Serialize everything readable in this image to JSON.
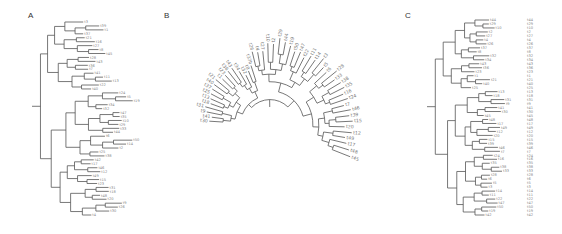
{
  "figure": {
    "panels": [
      {
        "label": "A",
        "type": "rectangular-tree",
        "tip_layout": "staggered"
      },
      {
        "label": "B",
        "type": "fan-tree"
      },
      {
        "label": "C",
        "type": "rectangular-tree",
        "tip_layout": "aligned"
      }
    ],
    "colors": {
      "branch": "#555555",
      "tip_label": "#888888",
      "panel_label": "#333333",
      "background": "#ffffff"
    }
  },
  "panelA": {
    "label": "A",
    "tips": [
      "t3",
      "t39",
      "t1",
      "t37",
      "t21",
      "t16",
      "t27",
      "t8",
      "t45",
      "t28",
      "t43",
      "t36",
      "t7",
      "t41",
      "t11",
      "t13",
      "t22",
      "t40",
      "t24",
      "t5",
      "t19",
      "t34",
      "t32",
      "t47",
      "t35",
      "t10",
      "t29",
      "t33",
      "t44",
      "t6",
      "t50",
      "t14",
      "t2",
      "t25",
      "t38",
      "t42",
      "t17",
      "t46",
      "t12",
      "t49",
      "t15",
      "t23",
      "t31",
      "t18",
      "t48",
      "t20",
      "t9",
      "t26",
      "t30",
      "t4"
    ]
  },
  "panelB": {
    "label": "B",
    "tips": [
      "t30",
      "t41",
      "t9",
      "t31",
      "t18",
      "t13",
      "t25",
      "t37",
      "t40",
      "t21",
      "t1",
      "t23",
      "t36",
      "t43",
      "t34",
      "t32",
      "t8",
      "t37b",
      "t26",
      "t4",
      "t27",
      "t10",
      "t2",
      "t29",
      "t44",
      "t19",
      "t50",
      "t47",
      "t22",
      "t11",
      "t14",
      "t3",
      "t5",
      "t6",
      "t28",
      "t33",
      "t38",
      "t35",
      "t16",
      "t24",
      "t7",
      "t46",
      "t39",
      "t15",
      "t20",
      "t12",
      "t49",
      "t17",
      "t48",
      "t45"
    ]
  },
  "panelC": {
    "label": "C",
    "tips": [
      "t44",
      "t29",
      "t10",
      "t2",
      "t27",
      "t4",
      "t26",
      "t37",
      "t8",
      "t32",
      "t34",
      "t43",
      "t36",
      "t23",
      "t1",
      "t21",
      "t40",
      "t25",
      "t13",
      "t18",
      "t31",
      "t9",
      "t41",
      "t30",
      "t45",
      "t48",
      "t17",
      "t49",
      "t12",
      "t20",
      "t15",
      "t39",
      "t46",
      "t7",
      "t24",
      "t16",
      "t35",
      "t38",
      "t33",
      "t28",
      "t6",
      "t5",
      "t3",
      "t14",
      "t11",
      "t22",
      "t47",
      "t50",
      "t19",
      "t42"
    ]
  }
}
